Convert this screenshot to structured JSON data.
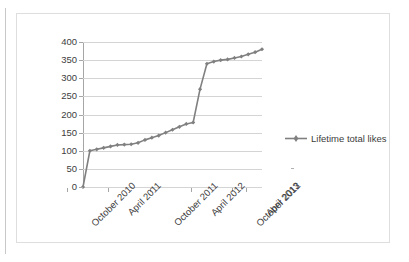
{
  "chart_data": {
    "type": "line",
    "title": "",
    "xlabel": "",
    "ylabel": "",
    "ylim": [
      0,
      400
    ],
    "ytick_step": 50,
    "ytick_labels": [
      "400",
      "350",
      "300",
      "250",
      "200",
      "150",
      "100",
      "50",
      "0"
    ],
    "ytick_values": [
      400,
      350,
      300,
      250,
      200,
      150,
      100,
      50,
      0
    ],
    "xtick_labels": [
      "October 2010",
      "April 2011",
      "October 2011",
      "April 2012",
      "October 2012",
      "April 2013"
    ],
    "grid": "horizontal",
    "legend_position": "right",
    "series": [
      {
        "name": "Lifetime total likes",
        "color": "#808080",
        "marker": "diamond",
        "x": [
          "October 2010",
          "November 2010",
          "December 2010",
          "January 2011",
          "February 2011",
          "March 2011",
          "April 2011",
          "May 2011",
          "June 2011",
          "July 2011",
          "August 2011",
          "September 2011",
          "October 2011",
          "November 2011",
          "December 2011",
          "January 2012",
          "February 2012",
          "April 2012",
          "October 2012",
          "January 2013",
          "February 2013",
          "March 2013",
          "April 2013",
          "May 2013",
          "June 2013",
          "July 2013",
          "August 2013"
        ],
        "values": [
          0,
          100,
          104,
          108,
          112,
          116,
          117,
          118,
          122,
          130,
          136,
          142,
          150,
          158,
          166,
          174,
          178,
          270,
          340,
          346,
          350,
          352,
          356,
          360,
          366,
          372,
          380
        ]
      }
    ]
  },
  "legend": {
    "entries": [
      {
        "label": "Lifetime total likes",
        "color": "#808080"
      }
    ]
  }
}
